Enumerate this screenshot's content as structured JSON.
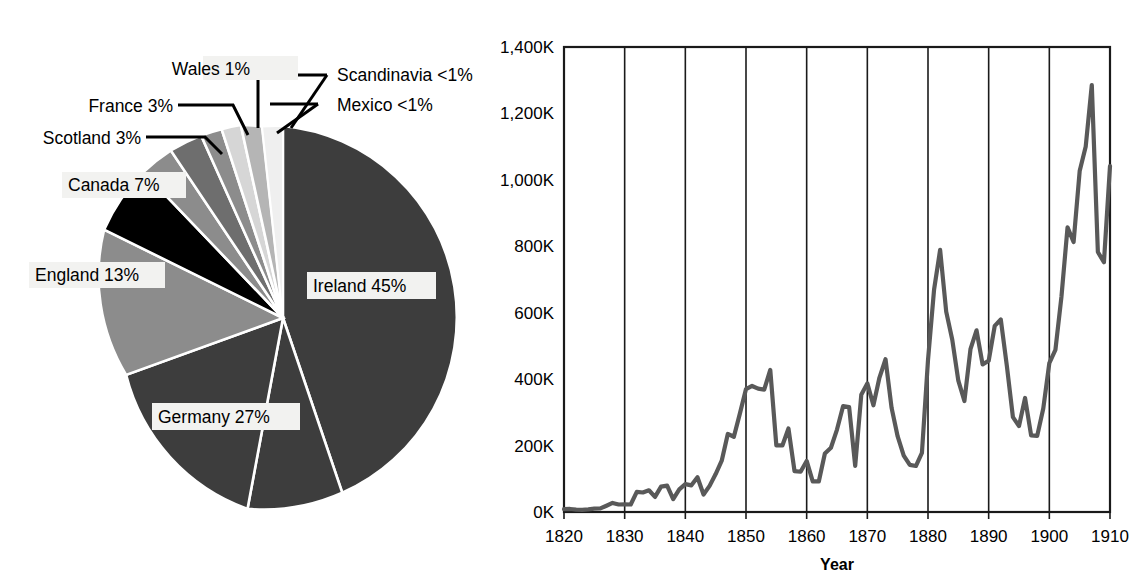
{
  "figure": {
    "title": "",
    "panels": [
      "pie-chart-origins",
      "line-chart-immigration-by-year"
    ]
  },
  "pie": {
    "labels": {
      "ireland": "Ireland 45%",
      "germany": "Germany 27%",
      "england": "England 13%",
      "canada": "Canada 7%",
      "scotland": "Scotland 3%",
      "france": "France 3%",
      "wales": "Wales 1%",
      "scandinavia": "Scandinavia <1%",
      "mexico": "Mexico <1%"
    },
    "colors": {
      "ireland": "#3d3d3d",
      "germany": "#3d3d3d",
      "england": "#8c8c8c",
      "canada": "#000000",
      "scotland": "#8c8c8c",
      "france": "#6e6e6e",
      "wales": "#8c8c8c",
      "scandinavia": "#d6d6d6",
      "mexico": "#b5b5b5",
      "separator": "#ffffff"
    }
  },
  "line": {
    "axis": {
      "xlabel": "Year",
      "ylabel": "",
      "yticks": [
        "0K",
        "200K",
        "400K",
        "600K",
        "800K",
        "1,000K",
        "1,200K",
        "1,400K"
      ],
      "xticks": [
        "1820",
        "1830",
        "1840",
        "1850",
        "1860",
        "1870",
        "1880",
        "1890",
        "1900",
        "1910"
      ]
    },
    "color": "#595959"
  },
  "chart_data": [
    {
      "type": "pie",
      "title": "",
      "labels": [
        "Ireland",
        "Germany",
        "England",
        "Canada",
        "Scotland",
        "France",
        "Wales",
        "Scandinavia",
        "Mexico"
      ],
      "values": [
        45,
        27,
        13,
        7,
        3,
        3,
        1,
        0.5,
        0.5
      ],
      "value_labels": [
        "45%",
        "27%",
        "13%",
        "7%",
        "3%",
        "3%",
        "1%",
        "<1%",
        "<1%"
      ],
      "unit": "percent",
      "legend": "none",
      "colors": [
        "#3d3d3d",
        "#3d3d3d",
        "#8c8c8c",
        "#000000",
        "#8c8c8c",
        "#6e6e6e",
        "#8c8c8c",
        "#d6d6d6",
        "#b5b5b5"
      ]
    },
    {
      "type": "line",
      "title": "",
      "xlabel": "Year",
      "ylabel": "",
      "xlim": [
        1820,
        1910
      ],
      "ylim": [
        0,
        1400000
      ],
      "ytick_values": [
        0,
        200000,
        400000,
        600000,
        800000,
        1000000,
        1200000,
        1400000
      ],
      "ytick_labels": [
        "0K",
        "200K",
        "400K",
        "600K",
        "800K",
        "1,000K",
        "1,200K",
        "1,400K"
      ],
      "xtick_values": [
        1820,
        1830,
        1840,
        1850,
        1860,
        1870,
        1880,
        1890,
        1900,
        1910
      ],
      "grid": "vertical-only",
      "legend": "none",
      "x": [
        1820,
        1821,
        1822,
        1823,
        1824,
        1825,
        1826,
        1827,
        1828,
        1829,
        1830,
        1831,
        1832,
        1833,
        1834,
        1835,
        1836,
        1837,
        1838,
        1839,
        1840,
        1841,
        1842,
        1843,
        1844,
        1845,
        1846,
        1847,
        1848,
        1849,
        1850,
        1851,
        1852,
        1853,
        1854,
        1855,
        1856,
        1857,
        1858,
        1859,
        1860,
        1861,
        1862,
        1863,
        1864,
        1865,
        1866,
        1867,
        1868,
        1869,
        1870,
        1871,
        1872,
        1873,
        1874,
        1875,
        1876,
        1877,
        1878,
        1879,
        1880,
        1881,
        1882,
        1883,
        1884,
        1885,
        1886,
        1887,
        1888,
        1889,
        1890,
        1891,
        1892,
        1893,
        1894,
        1895,
        1896,
        1897,
        1898,
        1899,
        1900,
        1901,
        1902,
        1903,
        1904,
        1905,
        1906,
        1907,
        1908,
        1909,
        1910
      ],
      "y": [
        8385,
        9127,
        6911,
        6354,
        7912,
        10199,
        10837,
        18875,
        27382,
        22520,
        23322,
        22633,
        60482,
        58640,
        65365,
        45374,
        76242,
        79340,
        38914,
        68069,
        84066,
        80289,
        104565,
        52496,
        78615,
        114371,
        154416,
        234968,
        226527,
        297024,
        369980,
        379466,
        371603,
        368645,
        427833,
        200877,
        200436,
        251306,
        123126,
        121282,
        153640,
        91918,
        91985,
        176282,
        193418,
        248120,
        318568,
        315722,
        138840,
        352768,
        387203,
        321350,
        404806,
        459803,
        313339,
        227498,
        169986,
        141857,
        138469,
        177826,
        457257,
        669431,
        788992,
        603322,
        518592,
        395346,
        334203,
        490109,
        546889,
        444427,
        455302,
        560319,
        579663,
        439730,
        285631,
        258536,
        343267,
        230832,
        229299,
        311715,
        448572,
        487918,
        648743,
        857046,
        812870,
        1026499,
        1100735,
        1285349,
        782870,
        751786,
        1041570
      ]
    }
  ]
}
